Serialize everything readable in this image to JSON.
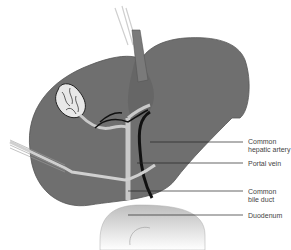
{
  "figure": {
    "type": "anatomical illustration",
    "colors": {
      "liver": "#6f6f6f",
      "liver_shadow": "#5a5a5a",
      "gallbladder": "#e8e8e8",
      "duct_light": "#c9c9c9",
      "bile_duct_dark": "#111111",
      "duodenum": "#d6d6d6",
      "leader_line": "#222222"
    }
  },
  "labels": [
    {
      "id": "common-hepatic-artery",
      "text": "Common\nhepatic artery"
    },
    {
      "id": "portal-vein",
      "text": "Portal vein"
    },
    {
      "id": "common-bile-duct",
      "text": "Common\nbile duct"
    },
    {
      "id": "duodenum",
      "text": "Duodenum"
    }
  ]
}
